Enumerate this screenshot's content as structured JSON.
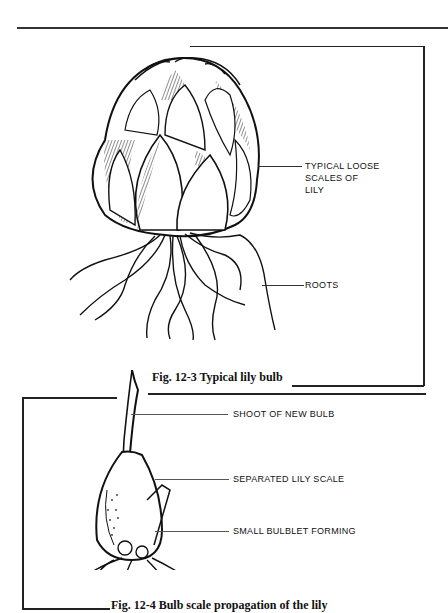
{
  "page": {
    "header_running_text": ""
  },
  "figure_1": {
    "caption": "Fig. 12-3  Typical lily bulb",
    "labels": {
      "scales": "TYPICAL LOOSE\nSCALES OF\nLILY",
      "roots": "ROOTS"
    }
  },
  "figure_2": {
    "caption": "Fig. 12-4  Bulb scale propagation of the lily",
    "labels": {
      "shoot": "SHOOT OF NEW BULB",
      "scale": "SEPARATED LILY SCALE",
      "bulblet": "SMALL BULBLET FORMING"
    }
  }
}
